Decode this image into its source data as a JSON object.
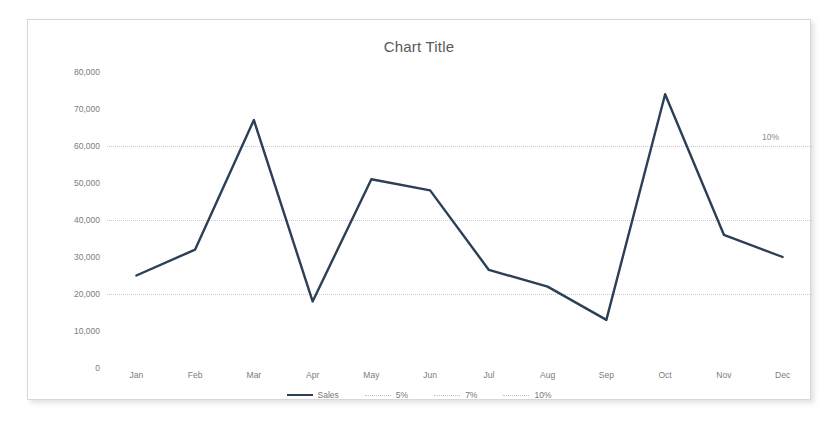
{
  "chart_data": {
    "type": "line",
    "title": "Chart Title",
    "xlabel": "",
    "ylabel": "",
    "categories": [
      "Jan",
      "Feb",
      "Mar",
      "Apr",
      "May",
      "Jun",
      "Jul",
      "Aug",
      "Sep",
      "Oct",
      "Nov",
      "Dec"
    ],
    "series": [
      {
        "name": "Sales",
        "color": "#2b3f56",
        "style": "solid",
        "values": [
          25000,
          32000,
          67000,
          18000,
          51000,
          48000,
          26500,
          22000,
          13000,
          74000,
          36000,
          30000
        ]
      }
    ],
    "reference_lines": [
      {
        "name": "5%",
        "value": 20000,
        "style": "dotted",
        "color": "#c9c9cf",
        "annotated": false
      },
      {
        "name": "7%",
        "value": 40000,
        "style": "dotted",
        "color": "#c9c9cf",
        "annotated": false
      },
      {
        "name": "10%",
        "value": 60000,
        "style": "dotted",
        "color": "#c9c9cf",
        "annotated": true,
        "annotation_text": "10%"
      }
    ],
    "ylim": [
      0,
      80000
    ],
    "ytick_values": [
      0,
      10000,
      20000,
      30000,
      40000,
      50000,
      60000,
      70000,
      80000
    ],
    "ytick_labels": [
      "0",
      "10,000",
      "20,000",
      "30,000",
      "40,000",
      "50,000",
      "60,000",
      "70,000",
      "80,000"
    ],
    "grid": true,
    "grid_axis": "y",
    "legend": {
      "position": "bottom",
      "entries": [
        {
          "label": "Sales",
          "style": "solid",
          "color": "#2b3f56"
        },
        {
          "label": "5%",
          "style": "dotted",
          "color": "#bfbfc6"
        },
        {
          "label": "7%",
          "style": "dotted",
          "color": "#bfbfc6"
        },
        {
          "label": "10%",
          "style": "dotted",
          "color": "#bfbfc6"
        }
      ]
    }
  },
  "colors": {
    "series_line": "#2b3f56",
    "gridline": "#c9c9cf",
    "axis_text": "#7c7c7c",
    "title_text": "#595959",
    "card_border": "#d8d8dc",
    "page_background": "#ffffff"
  }
}
